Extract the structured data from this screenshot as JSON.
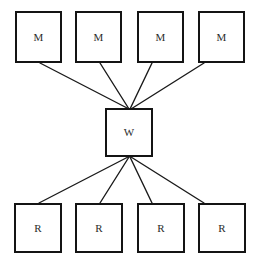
{
  "diagram": {
    "canvas": {
      "width": 253,
      "height": 265,
      "background": "#ffffff"
    },
    "style": {
      "node_border_color": "#141414",
      "node_border_width": 2,
      "node_fill": "#ffffff",
      "edge_color": "#1a1a1a",
      "edge_width": 1.4,
      "label_color": "#2b2b2b"
    },
    "nodes": [
      {
        "id": "m1",
        "label": "M",
        "role": "mapper",
        "x": 15,
        "y": 11,
        "w": 47,
        "h": 52
      },
      {
        "id": "m2",
        "label": "M",
        "role": "mapper",
        "x": 75,
        "y": 11,
        "w": 47,
        "h": 52
      },
      {
        "id": "m3",
        "label": "M",
        "role": "mapper",
        "x": 137,
        "y": 11,
        "w": 47,
        "h": 52
      },
      {
        "id": "m4",
        "label": "M",
        "role": "mapper",
        "x": 198,
        "y": 11,
        "w": 47,
        "h": 52
      },
      {
        "id": "w1",
        "label": "W",
        "role": "worker",
        "x": 105,
        "y": 108,
        "w": 48,
        "h": 49
      },
      {
        "id": "r1",
        "label": "R",
        "role": "reducer",
        "x": 14,
        "y": 203,
        "w": 48,
        "h": 50
      },
      {
        "id": "r2",
        "label": "R",
        "role": "reducer",
        "x": 75,
        "y": 203,
        "w": 48,
        "h": 50
      },
      {
        "id": "r3",
        "label": "R",
        "role": "reducer",
        "x": 137,
        "y": 203,
        "w": 48,
        "h": 50
      },
      {
        "id": "r4",
        "label": "R",
        "role": "reducer",
        "x": 198,
        "y": 203,
        "w": 48,
        "h": 50
      }
    ],
    "edges": [
      {
        "id": "e-m1-w",
        "from": "m1",
        "to": "w1",
        "x1": 40,
        "y1": 63,
        "x2": 129,
        "y2": 109
      },
      {
        "id": "e-m2-w",
        "from": "m2",
        "to": "w1",
        "x1": 100,
        "y1": 63,
        "x2": 129,
        "y2": 109
      },
      {
        "id": "e-m3-w",
        "from": "m3",
        "to": "w1",
        "x1": 152,
        "y1": 63,
        "x2": 130,
        "y2": 109
      },
      {
        "id": "e-m4-w",
        "from": "m4",
        "to": "w1",
        "x1": 204,
        "y1": 63,
        "x2": 131,
        "y2": 109
      },
      {
        "id": "e-w-r1",
        "from": "w1",
        "to": "r1",
        "x1": 128,
        "y1": 157,
        "x2": 39,
        "y2": 203
      },
      {
        "id": "e-w-r2",
        "from": "w1",
        "to": "r2",
        "x1": 129,
        "y1": 157,
        "x2": 100,
        "y2": 203
      },
      {
        "id": "e-w-r3",
        "from": "w1",
        "to": "r3",
        "x1": 130,
        "y1": 157,
        "x2": 152,
        "y2": 203
      },
      {
        "id": "e-w-r4",
        "from": "w1",
        "to": "r4",
        "x1": 131,
        "y1": 157,
        "x2": 204,
        "y2": 203
      }
    ]
  }
}
